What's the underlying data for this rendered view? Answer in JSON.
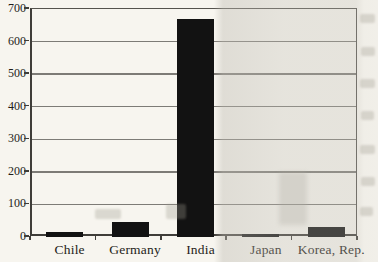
{
  "chart_data": {
    "type": "bar",
    "title": "",
    "categories": [
      "Chile",
      "Germany",
      "India",
      "Japan",
      "Korea, Rep."
    ],
    "values": [
      15,
      45,
      670,
      10,
      30
    ],
    "xlabel": "",
    "ylabel": "",
    "ylim": [
      0,
      700
    ],
    "yticks": [
      0,
      100,
      200,
      300,
      400,
      500,
      600,
      700
    ],
    "grid": true,
    "legend": false,
    "colors": {
      "bar": "#121212",
      "gridline": "#7d7b76",
      "axis": "#3f3d39",
      "text": "#1f1d19",
      "paper": "#f7f5ef"
    }
  }
}
